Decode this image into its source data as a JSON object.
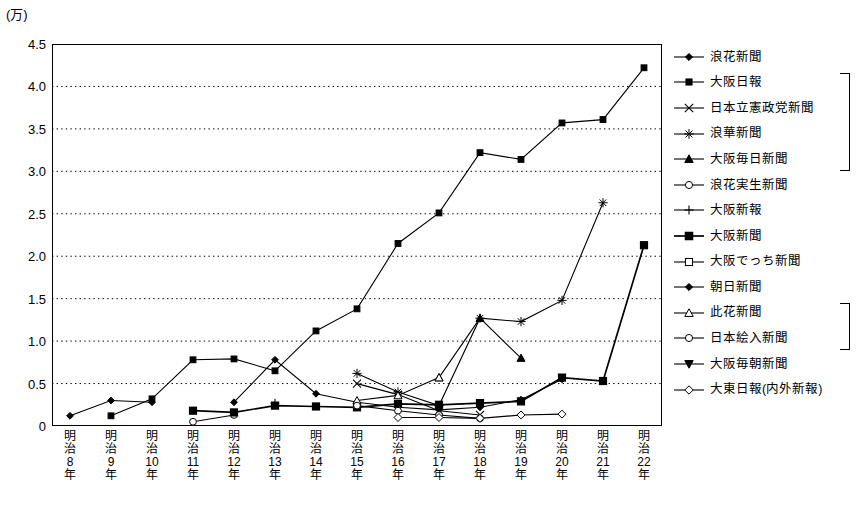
{
  "unit_label": "(万)",
  "chart_data": {
    "type": "line",
    "title": "",
    "xlabel": "",
    "ylabel": "(万)",
    "ylim": [
      0,
      4.5
    ],
    "yticks": [
      "0",
      "0.5",
      "1.0",
      "1.5",
      "2.0",
      "2.5",
      "3.0",
      "3.5",
      "4.0",
      "4.5"
    ],
    "grid": true,
    "legend_position": "right",
    "categories": [
      "明治8年",
      "明治9年",
      "明治10年",
      "明治11年",
      "明治12年",
      "明治13年",
      "明治14年",
      "明治15年",
      "明治16年",
      "明治17年",
      "明治18年",
      "明治19年",
      "明治20年",
      "明治21年",
      "明治22年"
    ],
    "category_lines": [
      [
        "明",
        "治",
        "8",
        "年"
      ],
      [
        "明",
        "治",
        "9",
        "年"
      ],
      [
        "明",
        "治",
        "10",
        "年"
      ],
      [
        "明",
        "治",
        "11",
        "年"
      ],
      [
        "明",
        "治",
        "12",
        "年"
      ],
      [
        "明",
        "治",
        "13",
        "年"
      ],
      [
        "明",
        "治",
        "14",
        "年"
      ],
      [
        "明",
        "治",
        "15",
        "年"
      ],
      [
        "明",
        "治",
        "16",
        "年"
      ],
      [
        "明",
        "治",
        "17",
        "年"
      ],
      [
        "明",
        "治",
        "18",
        "年"
      ],
      [
        "明",
        "治",
        "19",
        "年"
      ],
      [
        "明",
        "治",
        "20",
        "年"
      ],
      [
        "明",
        "治",
        "21",
        "年"
      ],
      [
        "明",
        "治",
        "22",
        "年"
      ]
    ],
    "series": [
      {
        "name": "浪花新聞",
        "marker": "diamond-filled",
        "values": [
          0.12,
          0.3,
          0.28,
          null,
          null,
          null,
          null,
          null,
          null,
          null,
          null,
          null,
          null,
          null,
          null
        ]
      },
      {
        "name": "大阪日報",
        "marker": "square-filled",
        "values": [
          null,
          0.12,
          0.32,
          0.78,
          0.79,
          0.65,
          1.12,
          1.38,
          2.15,
          2.51,
          3.22,
          3.14,
          3.57,
          3.61,
          4.22
        ]
      },
      {
        "name": "日本立憲政党新聞",
        "marker": "x",
        "values": [
          null,
          null,
          null,
          null,
          null,
          null,
          null,
          0.5,
          0.37,
          0.18,
          0.13,
          null,
          null,
          null,
          null
        ]
      },
      {
        "name": "浪華新聞",
        "marker": "asterisk",
        "values": [
          null,
          null,
          null,
          null,
          null,
          null,
          null,
          0.62,
          0.4,
          0.24,
          1.27,
          1.23,
          1.48,
          2.63,
          null
        ]
      },
      {
        "name": "大阪毎日新聞",
        "marker": "triangle-filled",
        "values": [
          null,
          null,
          null,
          null,
          null,
          null,
          null,
          null,
          null,
          0.57,
          1.27,
          0.8,
          null,
          null,
          null
        ]
      },
      {
        "name": "浪花実生新聞",
        "marker": "circle-open",
        "values": [
          null,
          null,
          null,
          0.05,
          0.13,
          null,
          null,
          null,
          null,
          null,
          null,
          null,
          null,
          null,
          null
        ]
      },
      {
        "name": "大阪新報",
        "marker": "plus",
        "values": [
          null,
          null,
          null,
          null,
          null,
          0.27,
          null,
          null,
          null,
          null,
          null,
          null,
          null,
          null,
          null
        ]
      },
      {
        "name": "大阪新聞",
        "marker": "square-filled-bold",
        "values": [
          null,
          null,
          null,
          0.18,
          0.16,
          0.24,
          0.23,
          0.22,
          0.26,
          0.25,
          0.27,
          0.29,
          0.57,
          0.53,
          2.13
        ]
      },
      {
        "name": "大阪でっち新聞",
        "marker": "square-open",
        "values": [
          null,
          null,
          null,
          null,
          null,
          null,
          null,
          null,
          null,
          null,
          null,
          null,
          null,
          null,
          null
        ]
      },
      {
        "name": "朝日新聞",
        "marker": "diamond-filled",
        "values": [
          null,
          null,
          null,
          null,
          0.28,
          0.78,
          0.38,
          0.28,
          0.22,
          0.19,
          0.22,
          0.31,
          0.55,
          null,
          null
        ]
      },
      {
        "name": "此花新聞",
        "marker": "triangle-open",
        "values": [
          null,
          null,
          null,
          null,
          null,
          null,
          null,
          0.3,
          0.36,
          0.57,
          null,
          null,
          null,
          null,
          null
        ]
      },
      {
        "name": "日本絵入新聞",
        "marker": "circle-open",
        "values": [
          null,
          null,
          null,
          null,
          null,
          null,
          null,
          0.24,
          0.18,
          0.13,
          0.09,
          null,
          null,
          null,
          null
        ]
      },
      {
        "name": "大阪毎朝新聞",
        "marker": "triangle-down-filled",
        "values": [
          null,
          null,
          null,
          null,
          null,
          null,
          null,
          null,
          null,
          null,
          null,
          null,
          null,
          null,
          null
        ]
      },
      {
        "name": "大東日報(内外新報)",
        "marker": "diamond-open",
        "values": [
          null,
          null,
          null,
          null,
          null,
          null,
          null,
          null,
          0.1,
          0.1,
          0.09,
          0.13,
          0.14,
          null,
          null
        ]
      }
    ]
  },
  "legend": {
    "items": [
      {
        "label": "浪花新聞",
        "marker": "diamond-filled"
      },
      {
        "label": "大阪日報",
        "marker": "square-filled"
      },
      {
        "label": "日本立憲政党新聞",
        "marker": "x"
      },
      {
        "label": "浪華新聞",
        "marker": "asterisk"
      },
      {
        "label": "大阪毎日新聞",
        "marker": "triangle-filled"
      },
      {
        "label": "浪花実生新聞",
        "marker": "circle-open"
      },
      {
        "label": "大阪新報",
        "marker": "plus"
      },
      {
        "label": "大阪新聞",
        "marker": "square-filled-bold"
      },
      {
        "label": "大阪でっち新聞",
        "marker": "square-open"
      },
      {
        "label": "朝日新聞",
        "marker": "diamond-filled"
      },
      {
        "label": "此花新聞",
        "marker": "triangle-open"
      },
      {
        "label": "日本絵入新聞",
        "marker": "circle-open"
      },
      {
        "label": "大阪毎朝新聞",
        "marker": "triangle-down-filled"
      },
      {
        "label": "大東日報(内外新報)",
        "marker": "diamond-open"
      }
    ],
    "brackets": [
      {
        "from": 1,
        "to": 4
      },
      {
        "from": 10,
        "to": 11
      }
    ]
  }
}
